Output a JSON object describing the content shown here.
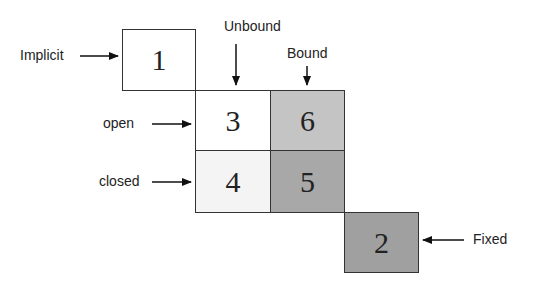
{
  "diagram": {
    "boxes": [
      {
        "id": "1",
        "label": "1",
        "fill": "#ffffff"
      },
      {
        "id": "3",
        "label": "3",
        "fill": "#ffffff"
      },
      {
        "id": "6",
        "label": "6",
        "fill": "#c4c4c4"
      },
      {
        "id": "4",
        "label": "4",
        "fill": "#f4f4f4"
      },
      {
        "id": "5",
        "label": "5",
        "fill": "#a8a8a8"
      },
      {
        "id": "2",
        "label": "2",
        "fill": "#a0a0a0"
      }
    ],
    "labels": {
      "implicit": "Implicit",
      "unbound": "Unbound",
      "bound": "Bound",
      "open": "open",
      "closed": "closed",
      "fixed": "Fixed"
    }
  }
}
